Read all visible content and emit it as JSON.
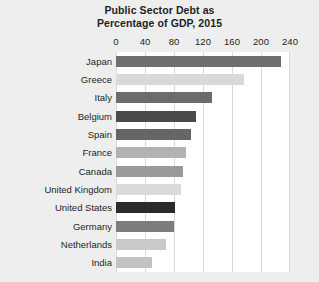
{
  "chart_data": {
    "type": "bar",
    "orientation": "horizontal",
    "title": "Public Sector Debt as Percentage of GDP, 2015",
    "title_lines": [
      "Public Sector Debt as",
      "Percentage of GDP, 2015"
    ],
    "xlabel": "",
    "ylabel": "",
    "xlim": [
      0,
      240
    ],
    "xticks": [
      0,
      40,
      80,
      120,
      160,
      200,
      240
    ],
    "xtick_labels": [
      "0",
      "40",
      "80",
      "120",
      "160",
      "200",
      "240"
    ],
    "grid": "vertical",
    "legend": "none",
    "categories": [
      "Japan",
      "Greece",
      "Italy",
      "Belgium",
      "Spain",
      "France",
      "Canada",
      "United Kingdom",
      "United States",
      "Germany",
      "Netherlands",
      "India"
    ],
    "values": [
      228,
      177,
      132,
      110,
      104,
      97,
      92,
      89,
      81,
      80,
      69,
      50
    ],
    "bar_colors": [
      "#6f6f6f",
      "#d9d9d9",
      "#6b6b6b",
      "#4a4a4a",
      "#666666",
      "#b2b2b2",
      "#9a9a9a",
      "#dadada",
      "#2b2b2b",
      "#7d7d7d",
      "#c9c9c9",
      "#c2c2c2"
    ],
    "highlight_category": "United States",
    "highlight_color": "#2b2b2b"
  },
  "figure": {
    "background_color": "#eeeeee",
    "plot_background_color": "#ffffff",
    "gridline_color": "#d9d9d9",
    "text_color": "#231f20"
  }
}
